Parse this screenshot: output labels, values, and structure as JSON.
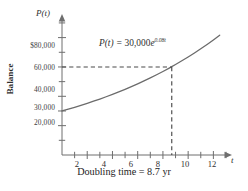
{
  "chart_data": {
    "type": "line",
    "title": "",
    "equation_label": "P(t) = 30,000e^{0.08t}",
    "equation_lhs": "P(t) = ",
    "equation_coefficient": "30,000",
    "equation_base": "e",
    "equation_exponent": "0.08t",
    "xlabel": "t",
    "ylabel": "Balance",
    "y_axis_name": "P(t)",
    "caption": "Doubling time = 8.7 yr",
    "xlim": [
      0,
      13
    ],
    "ylim": [
      0,
      92000
    ],
    "grid": false,
    "legend": "none",
    "x_ticks_major": [
      2,
      4,
      6,
      8,
      10,
      12
    ],
    "x_tick_labels": [
      "2",
      "4",
      "6",
      "8",
      "10",
      "12"
    ],
    "x_ticks_minor": [
      1,
      3,
      5,
      7,
      9,
      11,
      13
    ],
    "y_ticks_labeled": [
      80000,
      60000,
      40000,
      30000,
      20000
    ],
    "y_tick_labels": [
      "$80,000",
      "60,000",
      "40,000",
      "30,000",
      "20,000"
    ],
    "y_ticks_minor": [
      10000,
      50000,
      70000,
      90000
    ],
    "initial_value": 30000,
    "growth_rate": 0.08,
    "doubling_time": 8.7,
    "doubled_value": 60000,
    "marker_point": {
      "x": 8.7,
      "y": 60000
    },
    "series": [
      {
        "name": "P(t) = 30,000e^{0.08t}",
        "color": "#6b6b6b",
        "x": [
          0,
          0.5,
          1,
          1.5,
          2,
          2.5,
          3,
          3.5,
          4,
          4.5,
          5,
          5.5,
          6,
          6.5,
          7,
          7.5,
          8,
          8.5,
          8.7,
          9,
          9.5,
          10,
          10.5,
          11,
          11.5,
          12,
          12.5
        ],
        "values": [
          30000,
          31224,
          32498,
          33824,
          35205,
          36643,
          38139,
          39696,
          41318,
          43005,
          44762,
          46590,
          48493,
          50474,
          52536,
          54683,
          56918,
          59244,
          60197,
          61665,
          64186,
          66811,
          69543,
          72387,
          75347,
          78427,
          81633
        ]
      }
    ],
    "annotations": [
      {
        "type": "dashed-horizontal",
        "y": 60000,
        "from_x": 0,
        "to_x": 8.7
      },
      {
        "type": "dashed-vertical",
        "x": 8.7,
        "from_y": 0,
        "to_y": 60000
      }
    ],
    "colors": {
      "curve": "#6b6b6b",
      "axis": "#6e6e6e",
      "dashed": "#4a4a4a",
      "text": "#2f2f2f",
      "background": "#ffffff"
    }
  }
}
